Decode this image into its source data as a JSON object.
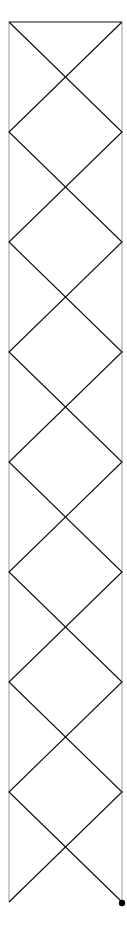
{
  "diagram": {
    "type": "double-zigzag-in-rails",
    "width": 127,
    "height": 928,
    "background": "#ffffff",
    "rails": {
      "left_x": 9,
      "right_x": 122,
      "top_y": 22,
      "bottom_y": 902,
      "color": "#9a9a9a",
      "stroke_width": 1
    },
    "top_bar": {
      "x1": 9,
      "x2": 122,
      "y": 22,
      "color": "#111111",
      "stroke_width": 1.2
    },
    "zigzag": {
      "vertex_ys": [
        22,
        132,
        242,
        352,
        462,
        572,
        682,
        792,
        902
      ],
      "color": "#111111",
      "stroke_width": 1.2,
      "paths": [
        {
          "name": "zigzag-from-left",
          "start_side": "left"
        },
        {
          "name": "zigzag-from-right",
          "start_side": "right"
        }
      ]
    },
    "end_marker": {
      "cx": 122,
      "cy": 903,
      "r": 3.2,
      "color": "#000000"
    }
  }
}
